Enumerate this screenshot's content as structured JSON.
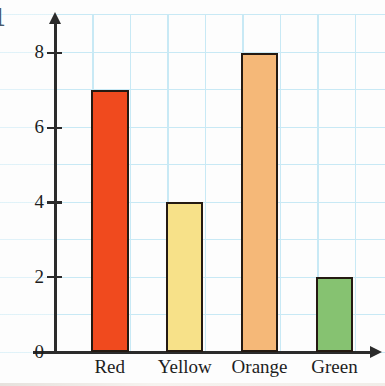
{
  "figure": {
    "problem_number": "1",
    "background_color": "#ffffff",
    "grid_color": "#9ed9ef",
    "axis_color": "#2b2b2b",
    "bar_outline_color": "#241a12"
  },
  "chart_data": {
    "type": "bar",
    "title": "",
    "xlabel": "",
    "ylabel": "",
    "categories": [
      "Red",
      "Yellow",
      "Orange",
      "Green"
    ],
    "values": [
      7,
      4,
      8,
      2
    ],
    "bar_colors": [
      "#f04a1e",
      "#f7e189",
      "#f5b878",
      "#86c271"
    ],
    "ylim": [
      0,
      9
    ],
    "ytick_labels": [
      "0",
      "2",
      "4",
      "6",
      "8"
    ],
    "ytick_values": [
      0,
      2,
      4,
      6,
      8
    ],
    "grid": true,
    "legend": "none"
  },
  "axes": {
    "y_ticks": [
      {
        "label": "0",
        "value": 0
      },
      {
        "label": "2",
        "value": 2
      },
      {
        "label": "4",
        "value": 4
      },
      {
        "label": "6",
        "value": 6
      },
      {
        "label": "8",
        "value": 8
      }
    ],
    "x_categories": [
      {
        "label": "Red"
      },
      {
        "label": "Yellow"
      },
      {
        "label": "Orange"
      },
      {
        "label": "Green"
      }
    ]
  }
}
